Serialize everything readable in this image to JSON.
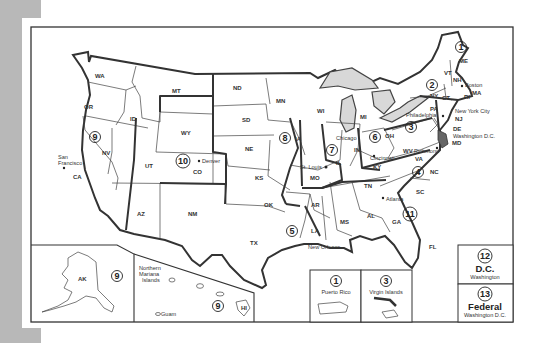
{
  "map": {
    "title": "U.S. Federal Circuit Courts Map",
    "colors": {
      "background": "#ffffff",
      "margin_gray": "#b8b8b8",
      "border": "#333333",
      "lakes": "#d8d8d8"
    },
    "states": {
      "WA": "WA",
      "OR": "OR",
      "CA": "CA",
      "NV": "NV",
      "ID": "ID",
      "MT": "MT",
      "WY": "WY",
      "UT": "UT",
      "AZ": "AZ",
      "CO": "CO",
      "NM": "NM",
      "ND": "ND",
      "SD": "SD",
      "NE": "NE",
      "KS": "KS",
      "OK": "OK",
      "TX": "TX",
      "MN": "MN",
      "IA": "IA",
      "MO": "MO",
      "AR": "AR",
      "LA": "LA",
      "WI": "WI",
      "IL": "IL",
      "IN": "IN",
      "MI": "MI",
      "OH": "OH",
      "KY": "KY",
      "TN": "TN",
      "MS": "MS",
      "AL": "AL",
      "GA": "GA",
      "FL": "FL",
      "SC": "SC",
      "NC": "NC",
      "VA": "VA",
      "WV": "WV",
      "PA": "PA",
      "NY": "NY",
      "NJ": "NJ",
      "DE": "DE",
      "MD": "MD",
      "CT": "CT",
      "RI": "RI",
      "MA": "MA",
      "VT": "VT",
      "NH": "NH",
      "ME": "ME",
      "AK": "AK",
      "HI": "HI"
    },
    "cities": {
      "san_francisco_1": "San",
      "san_francisco_2": "Francisco",
      "denver": "Denver",
      "st_louis": "St. Louis",
      "chicago": "Chicago",
      "cincinnati": "Cincinnati",
      "new_orleans": "New Orleans",
      "atlanta": "Atlanta",
      "richmond": "Richmond",
      "philadelphia": "Philadelphia",
      "new_york": "New York City",
      "boston": "Boston",
      "washington_dc": "Washington D.C."
    },
    "circuits": {
      "c1": "1",
      "c2": "2",
      "c3": "3",
      "c4": "4",
      "c5": "5",
      "c6": "6",
      "c7": "7",
      "c8": "8",
      "c9": "9",
      "c10": "10",
      "c11": "11",
      "c12": "12",
      "c13": "13"
    },
    "insets": {
      "alaska": {
        "label": "AK",
        "circuit": "9"
      },
      "pacific": {
        "title_1": "Northern",
        "title_2": "Mariana",
        "title_3": "Islands",
        "guam": "Guam",
        "hawaii": "HI",
        "circuit": "9"
      },
      "puerto_rico": {
        "circuit": "1",
        "label": "Puerto Rico"
      },
      "virgin_islands": {
        "circuit": "3",
        "label": "Virgin Islands"
      },
      "dc": {
        "circuit": "12",
        "label": "D.C.",
        "sub": "Washington"
      },
      "federal": {
        "circuit": "13",
        "label": "Federal",
        "sub": "Washington D.C."
      }
    }
  }
}
